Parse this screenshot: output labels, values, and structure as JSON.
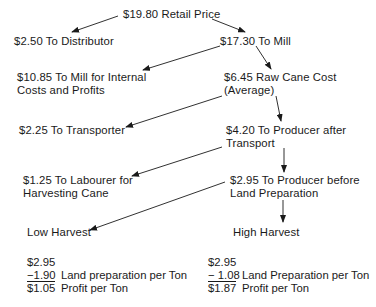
{
  "nodes": {
    "retail": "$19.80 Retail Price",
    "distributor": "$2.50 To Distributor",
    "mill": "$17.30 To Mill",
    "mill_internal": [
      "$10.85 To Mill for Internal",
      "Costs and Profits"
    ],
    "raw_cane": [
      "$6.45 Raw Cane Cost",
      "(Average)"
    ],
    "transporter": "$2.25 To Transporter",
    "producer_after_transport": [
      "$4.20 To Producer after",
      "Transport"
    ],
    "labourer": [
      "$1.25 To Labourer for",
      "Harvesting Cane"
    ],
    "producer_before_land": [
      "$2.95 To Producer before",
      "Land Preparation"
    ],
    "low_harvest": "Low Harvest",
    "high_harvest": "High Harvest"
  },
  "calculations": {
    "low": {
      "start": "$2.95",
      "minus": "−1.90",
      "minus_label": "Land preparation per Ton",
      "result": "$1.05",
      "result_label": "Profit per Ton"
    },
    "high": {
      "start": "$2.95",
      "minus": "− 1.08",
      "minus_label": "Land Preparation per Ton",
      "result": "$1.87",
      "result_label": "Profit per Ton"
    }
  },
  "colors": {
    "ink": "#1a1a1a",
    "background": "#ffffff"
  }
}
